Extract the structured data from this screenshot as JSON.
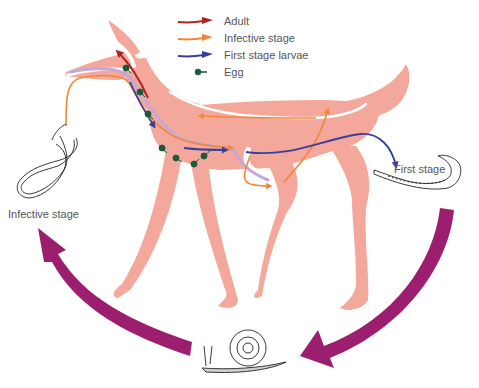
{
  "legend": {
    "items": [
      {
        "label": "Adult",
        "color": "#b22222",
        "kind": "arrow"
      },
      {
        "label": "Infective stage",
        "color": "#f0883a",
        "kind": "arrow"
      },
      {
        "label": "First stage larvae",
        "color": "#3a3f9a",
        "kind": "arrow"
      },
      {
        "label": "Egg",
        "color": "#1e5a3a",
        "kind": "dot"
      }
    ]
  },
  "labels": {
    "infective_stage": "Infective stage",
    "first_stage": "First stage"
  },
  "colors": {
    "host_body": "#f4a79b",
    "cycle_arrow": "#9b1f6e",
    "adult": "#b22222",
    "infective": "#f0883a",
    "first_stage_larvae": "#3a3f9a",
    "egg": "#1e5a3a",
    "lavender_path": "#c4a8d8"
  }
}
